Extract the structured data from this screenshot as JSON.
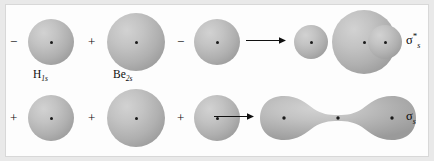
{
  "figure": {
    "background_color": "#fdfdfd",
    "border_color": "#d8d8d8",
    "orbital_fill_color": "#b0b0b0",
    "nucleus_color": "#1a1a1a",
    "text_color": "#0d0d0d"
  },
  "rows": [
    {
      "id": "antibonding",
      "name": "antibonding-row",
      "operators": [
        "−",
        "+",
        "−"
      ],
      "arrow": "→",
      "result_label_sigma": "σ",
      "result_label_star": "*",
      "result_label_sub": "s",
      "captions": [
        {
          "element": "H",
          "sub": "1s"
        },
        {
          "element": "Be",
          "sub": "2s"
        }
      ]
    },
    {
      "id": "bonding",
      "name": "bonding-row",
      "operators": [
        "+",
        "+",
        "+"
      ],
      "arrow": "→",
      "result_label_sigma": "σ",
      "result_label_star": "",
      "result_label_sub": "s",
      "captions": []
    }
  ],
  "antibonding": {
    "op_1": "−",
    "op_2": "+",
    "op_3": "−",
    "caption_h": "H",
    "caption_h_sub": "1s",
    "caption_be": "Be",
    "caption_be_sub": "2s",
    "sigma": "σ",
    "star": "*",
    "sub": "s"
  },
  "bonding": {
    "op_1": "+",
    "op_2": "+",
    "op_3": "+",
    "sigma": "σ",
    "sub": "s"
  }
}
